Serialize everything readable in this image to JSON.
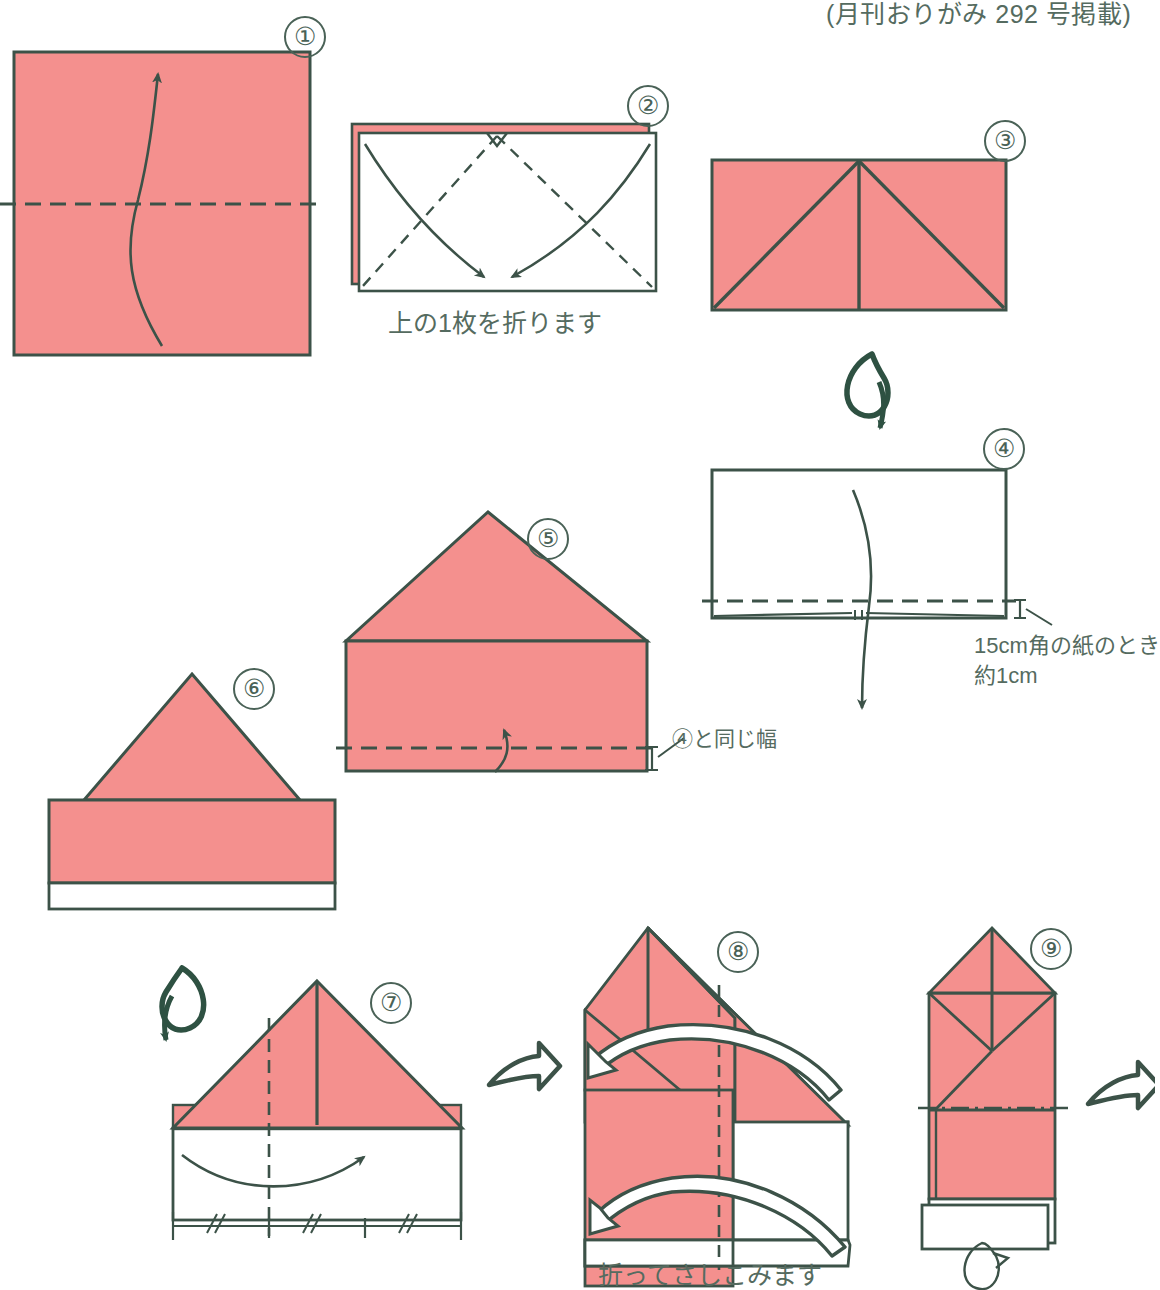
{
  "diagram": {
    "title_note": "(月刊おりがみ 292 号掲載)",
    "colors": {
      "paper_front": "#F4908E",
      "paper_back": "#FFFFFF",
      "line": "#3C5248",
      "text": "#556B60",
      "arrow": "#2E5142"
    },
    "steps": [
      {
        "number": "①",
        "label": "square-sheet-valley-fold-up",
        "caption": "",
        "fold": "valley",
        "fold_direction": "up"
      },
      {
        "number": "②",
        "label": "fold-top-layer-corners-down",
        "caption": "上の1枚を折ります",
        "fold": "valley",
        "fold_direction": "down"
      },
      {
        "number": "③",
        "label": "triangle-flap-result",
        "caption": ""
      },
      {
        "number": "④",
        "label": "turn-over-fold-bottom-edge-up",
        "caption": "",
        "measure_line1": "15cm角の紙のとき",
        "measure_line2": "約1cm",
        "fold": "valley"
      },
      {
        "number": "⑤",
        "label": "house-shape-fold-band-up",
        "caption": "",
        "measure_note": "④と同じ幅",
        "fold": "valley",
        "fold_direction": "up"
      },
      {
        "number": "⑥",
        "label": "house-shape-with-white-band",
        "caption": ""
      },
      {
        "number": "⑦",
        "label": "fold-thirds-sides-in",
        "caption": "",
        "divisions": 3,
        "tick_marks": [
          "//",
          "//",
          "//"
        ]
      },
      {
        "number": "⑧",
        "label": "fold-and-tuck-in",
        "caption": "折ってさしこみます"
      },
      {
        "number": "⑨",
        "label": "completed-pointed-form",
        "caption": ""
      }
    ],
    "symbols": [
      {
        "name": "turn-over-loop-arrow",
        "between": "③→④"
      },
      {
        "name": "turn-over-loop-arrow-mirrored",
        "between": "⑥→⑦"
      },
      {
        "name": "next-step-block-arrow",
        "between": "⑦→⑧"
      },
      {
        "name": "next-step-block-arrow",
        "between": "⑨→next"
      }
    ]
  }
}
